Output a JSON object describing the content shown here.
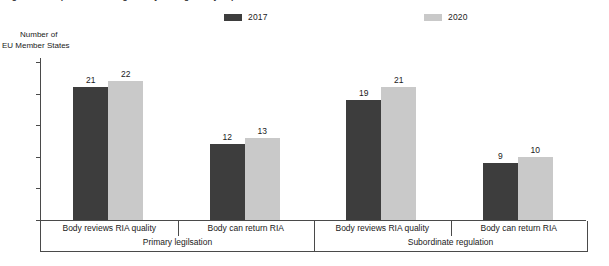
{
  "figure": {
    "title": "Figure 1. Independent oversight body for regulatory impact assessment in EU Member States",
    "y_caption_line1": "Number of",
    "y_caption_line2": "EU Member States"
  },
  "legend": {
    "position": "top-center",
    "entries": [
      {
        "label": "2017",
        "color": "#3d3d3d",
        "name": "legend-2017"
      },
      {
        "label": "2020",
        "color": "#c9c9c9",
        "name": "legend-2020"
      }
    ]
  },
  "chart_data": {
    "type": "bar",
    "title": "Figure 1. Independent oversight body for regulatory impact assessment in EU Member States",
    "xlabel": "",
    "ylabel": "Number of EU Member States",
    "ylim": [
      0,
      25
    ],
    "yticks": [
      0,
      5,
      10,
      15,
      20,
      25
    ],
    "grid": false,
    "legend_position": "top-center",
    "categories": [
      "Body reviews RIA quality",
      "Body can return RIA",
      "Body reviews RIA quality",
      "Body can return RIA"
    ],
    "groups": [
      {
        "label": "Primary legilsation",
        "categories": [
          "Body reviews RIA quality",
          "Body can return RIA"
        ]
      },
      {
        "label": "Subordinate regulation",
        "categories": [
          "Body reviews RIA quality",
          "Body can return RIA"
        ]
      }
    ],
    "series": [
      {
        "name": "2017",
        "color": "#3d3d3d",
        "values": [
          21,
          12,
          19,
          9
        ]
      },
      {
        "name": "2020",
        "color": "#c9c9c9",
        "values": [
          22,
          13,
          21,
          10
        ]
      }
    ]
  }
}
